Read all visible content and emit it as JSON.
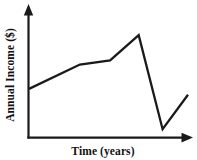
{
  "chart_data": {
    "type": "line",
    "title": "",
    "xlabel": "Time (years)",
    "ylabel": "Annual Income ($)",
    "x": [
      0,
      3.2,
      5.1,
      6.9,
      8.4,
      10.0
    ],
    "values": [
      2.9,
      4.35,
      4.6,
      6.1,
      0.5,
      2.55
    ],
    "series": [
      {
        "name": "Annual Income",
        "values": [
          2.9,
          4.35,
          4.6,
          6.1,
          0.5,
          2.55
        ]
      }
    ],
    "point_labels": [
      "start",
      "slow-rise-bend",
      "steeper-rise",
      "peak",
      "trough",
      "partial-recovery"
    ],
    "xlim": [
      0,
      10
    ],
    "ylim": [
      0,
      7
    ],
    "xticks": [],
    "yticks": [],
    "xticklabels": [],
    "yticklabels": [],
    "grid": false,
    "legend": false,
    "legend_position": "none",
    "axis_arrows": true,
    "line_color": "#1a1a1a",
    "axis_color": "#1a1a1a",
    "background_color": "#ffffff",
    "annotations": []
  },
  "axes": {
    "x_axis_name": "horizontal-axis",
    "y_axis_name": "vertical-axis",
    "xlabel": "Time (years)",
    "ylabel": "Annual Income ($)"
  }
}
